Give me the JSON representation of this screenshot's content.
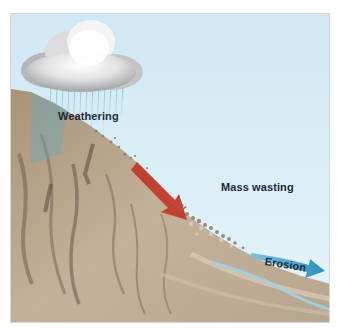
{
  "figure": {
    "labels": {
      "weathering": "Weathering",
      "mass_wasting": "Mass wasting",
      "gravity": "Gravity",
      "erosion": "Erosion"
    },
    "elements": {
      "cloud": "rain-cloud",
      "rain": "rain-streaks",
      "slope": "mountain-slope",
      "debris": "rock-debris",
      "stream": "stream",
      "gravity_arrow": "red-arrow",
      "erosion_arrow": "blue-arrow"
    },
    "colors": {
      "sky": "#d6ecf5",
      "cloud": "#e9e9ea",
      "rock": "#b9a58c",
      "rock_dark": "#7d6d5c",
      "gravity_arrow": "#c0412f",
      "erosion_arrow": "#3d9cc4",
      "rain": "#5fa9c9",
      "label_text": "#1e2a35"
    }
  }
}
